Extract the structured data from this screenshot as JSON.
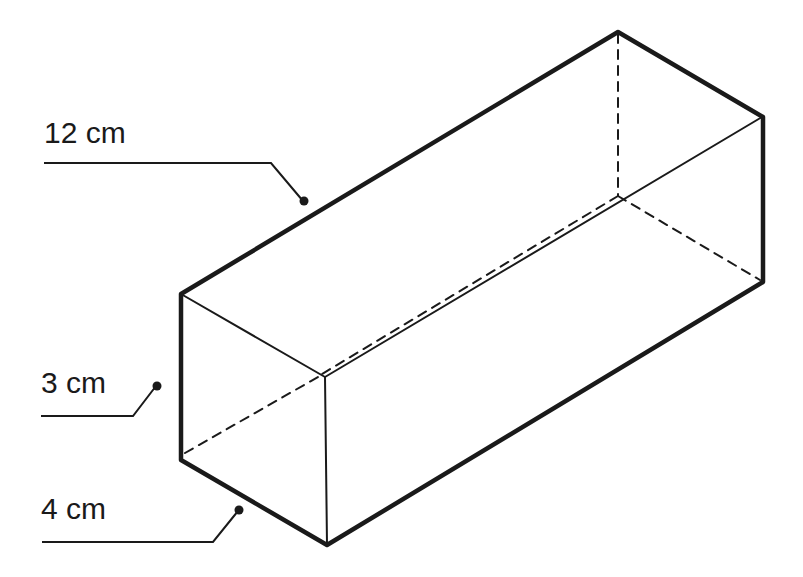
{
  "diagram": {
    "type": "rectangular-prism",
    "colors": {
      "line": "#1a1a1a",
      "background": "#ffffff"
    },
    "labels": {
      "length": "12 cm",
      "height": "3 cm",
      "width": "4 cm"
    },
    "dimensions": [
      {
        "name": "length",
        "value": 12,
        "unit": "cm"
      },
      {
        "name": "height",
        "value": 3,
        "unit": "cm"
      },
      {
        "name": "width",
        "value": 4,
        "unit": "cm"
      }
    ]
  }
}
